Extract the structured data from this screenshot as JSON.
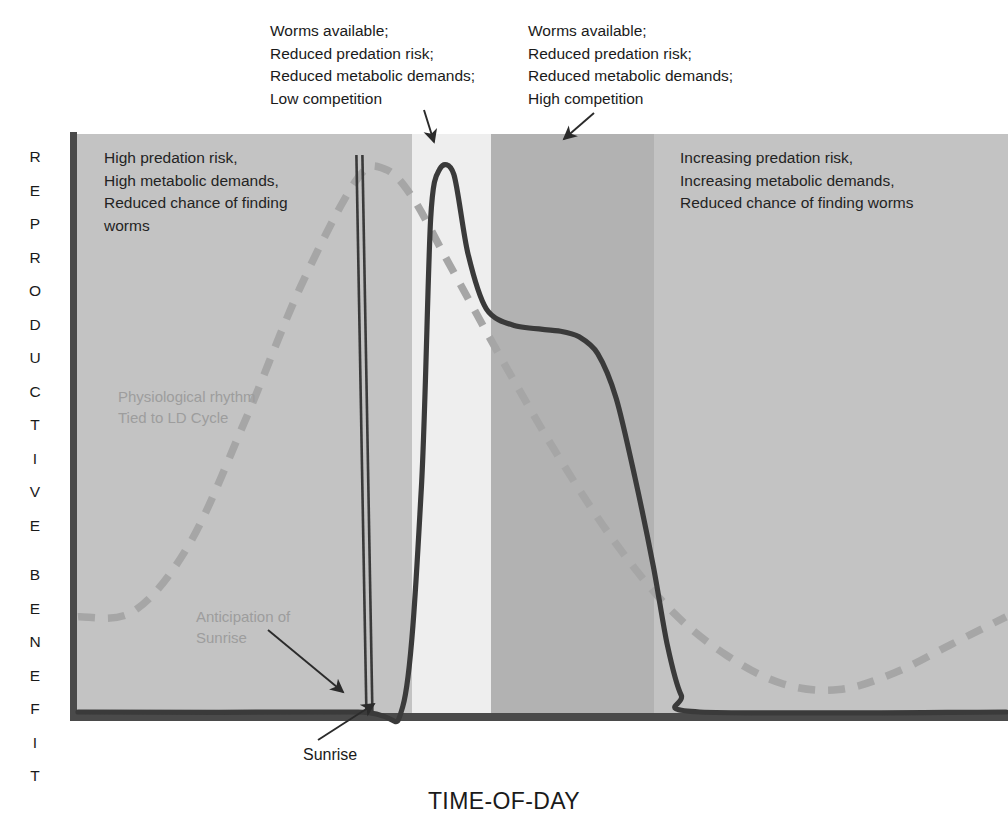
{
  "axes": {
    "y_title": "REPRODUCTIVE BENEFIT",
    "y_title_letters": [
      "R",
      "E",
      "P",
      "R",
      "O",
      "D",
      "U",
      "C",
      "T",
      "I",
      "V",
      "E",
      "",
      "B",
      "E",
      "N",
      "E",
      "F",
      "I",
      "T"
    ],
    "x_title": "TIME-OF-DAY"
  },
  "annotations": {
    "top_left": "Worms available;\nReduced predation risk;\nReduced metabolic demands;\nLow competition",
    "top_right": "Worms available;\nReduced predation risk;\nReduced metabolic demands;\nHigh competition",
    "chart_left": "High predation risk,\nHigh metabolic demands,\nReduced chance of finding\nworms",
    "chart_right": "Increasing predation risk,\nIncreasing metabolic demands,\nReduced chance of finding worms",
    "physiological": "Physiological rhythm\nTied to LD Cycle",
    "anticipation": "Anticipation of\nSunrise",
    "sunrise": "Sunrise"
  },
  "colors": {
    "band_night": "#c3c3c3",
    "band_dawn": "#eeeeee",
    "band_morning": "#b2b2b2",
    "band_day": "#c3c3c3",
    "axis": "#4a4a4a",
    "solid_curve": "#3a3a3a",
    "dashed_curve": "#a6a6a6",
    "faint_text": "#9d9d9d",
    "text": "#1a1a1a"
  },
  "chart_data": {
    "type": "line",
    "title": "",
    "xlabel": "TIME-OF-DAY",
    "ylabel": "REPRODUCTIVE BENEFIT",
    "xlim": [
      0,
      100
    ],
    "ylim": [
      0,
      100
    ],
    "grid": false,
    "legend": "none",
    "axis_ticks": [],
    "background_bands": [
      {
        "name": "pre-dawn-night",
        "x_start": 0,
        "x_end": 36,
        "color": "#c3c3c3",
        "label": "High predation risk"
      },
      {
        "name": "dawn-window",
        "x_start": 36,
        "x_end": 44.5,
        "color": "#eeeeee",
        "label": "Low competition window"
      },
      {
        "name": "early-morning",
        "x_start": 44.5,
        "x_end": 62,
        "color": "#b2b2b2",
        "label": "High competition window"
      },
      {
        "name": "day",
        "x_start": 62,
        "x_end": 100,
        "color": "#c3c3c3",
        "label": "Increasing predation risk"
      }
    ],
    "markers": [
      {
        "name": "sunrise",
        "type": "vertical-double-line",
        "x": 30,
        "label": "Sunrise"
      }
    ],
    "series": [
      {
        "name": "Physiological rhythm Tied to LD Cycle",
        "style": "dashed",
        "color": "#a6a6a6",
        "points": [
          {
            "x": 0,
            "y": 17
          },
          {
            "x": 6,
            "y": 18
          },
          {
            "x": 12,
            "y": 30
          },
          {
            "x": 18,
            "y": 52
          },
          {
            "x": 24,
            "y": 76
          },
          {
            "x": 30,
            "y": 95
          },
          {
            "x": 33,
            "y": 97
          },
          {
            "x": 36,
            "y": 92
          },
          {
            "x": 40,
            "y": 80
          },
          {
            "x": 46,
            "y": 62
          },
          {
            "x": 52,
            "y": 45
          },
          {
            "x": 58,
            "y": 30
          },
          {
            "x": 64,
            "y": 18
          },
          {
            "x": 70,
            "y": 10
          },
          {
            "x": 76,
            "y": 5
          },
          {
            "x": 82,
            "y": 4
          },
          {
            "x": 88,
            "y": 7
          },
          {
            "x": 94,
            "y": 12
          },
          {
            "x": 100,
            "y": 17
          }
        ]
      },
      {
        "name": "Reproductive benefit of singing",
        "style": "solid",
        "color": "#3a3a3a",
        "points": [
          {
            "x": 0,
            "y": 0
          },
          {
            "x": 30,
            "y": 0
          },
          {
            "x": 35,
            "y": 1
          },
          {
            "x": 37,
            "y": 40
          },
          {
            "x": 38,
            "y": 88
          },
          {
            "x": 39,
            "y": 97
          },
          {
            "x": 40.5,
            "y": 96
          },
          {
            "x": 42,
            "y": 82
          },
          {
            "x": 44,
            "y": 72
          },
          {
            "x": 47,
            "y": 69
          },
          {
            "x": 52,
            "y": 68
          },
          {
            "x": 54,
            "y": 67
          },
          {
            "x": 56,
            "y": 64
          },
          {
            "x": 58,
            "y": 56
          },
          {
            "x": 60,
            "y": 42
          },
          {
            "x": 62,
            "y": 26
          },
          {
            "x": 63.5,
            "y": 12
          },
          {
            "x": 65,
            "y": 3
          },
          {
            "x": 67,
            "y": 0
          },
          {
            "x": 100,
            "y": 0
          }
        ]
      }
    ],
    "arrows": [
      {
        "from_label": "top_left",
        "points_to": "dawn-window"
      },
      {
        "from_label": "top_right",
        "points_to": "early-morning"
      },
      {
        "from_label": "anticipation",
        "points_to": "sunrise-marker"
      },
      {
        "from_label": "sunrise",
        "points_to": "curve-onset"
      }
    ]
  }
}
